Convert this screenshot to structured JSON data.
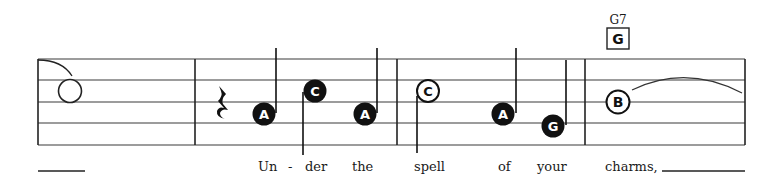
{
  "score": {
    "staff": {
      "left": 38,
      "right": 745,
      "lines_y": [
        59,
        80,
        102,
        123,
        145
      ],
      "color": "#3a3a3a"
    },
    "barlines_x": [
      38,
      195,
      397,
      585,
      745
    ],
    "chord_symbol": {
      "name": "G7",
      "boxed_letter": "G",
      "x": 618
    },
    "rest": {
      "type": "quarter-rest",
      "x": 222
    },
    "notes": [
      {
        "letter": "",
        "style": "open",
        "x": 70,
        "y": 91,
        "stem": "none"
      },
      {
        "letter": "A",
        "style": "filled",
        "x": 264,
        "y": 114,
        "stem": "up"
      },
      {
        "letter": "C",
        "style": "filled",
        "x": 315,
        "y": 91,
        "stem": "down"
      },
      {
        "letter": "A",
        "style": "filled",
        "x": 365,
        "y": 114,
        "stem": "up"
      },
      {
        "letter": "C",
        "style": "open",
        "x": 428,
        "y": 91,
        "stem": "down"
      },
      {
        "letter": "A",
        "style": "filled",
        "x": 503,
        "y": 114,
        "stem": "up"
      },
      {
        "letter": "G",
        "style": "filled",
        "x": 553,
        "y": 126,
        "stem": "up"
      },
      {
        "letter": "B",
        "style": "open-bold",
        "x": 618,
        "y": 102,
        "stem": "none"
      }
    ],
    "lyrics": [
      {
        "text": "Un",
        "x": 258
      },
      {
        "text": "-",
        "x": 288
      },
      {
        "text": "der",
        "x": 305
      },
      {
        "text": "the",
        "x": 352
      },
      {
        "text": "spell",
        "x": 414
      },
      {
        "text": "of",
        "x": 498
      },
      {
        "text": "your",
        "x": 537
      },
      {
        "text": "charms,",
        "x": 605
      }
    ],
    "lyric_extenders": [
      {
        "x1": 38,
        "x2": 85
      },
      {
        "x1": 662,
        "x2": 745
      }
    ]
  }
}
